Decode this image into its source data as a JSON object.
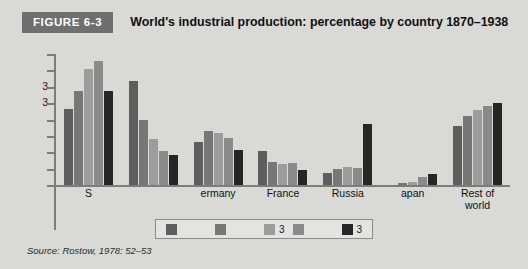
{
  "figure": {
    "badge": "FIGURE 6-3",
    "title": "World's industrial production: percentage by country 1870–1938"
  },
  "source": {
    "text": "Source: Rostow, 1978: 52–53"
  },
  "chart_data": {
    "type": "bar",
    "title": "World's industrial production: percentage by country 1870–1938",
    "xlabel": "",
    "ylabel": "",
    "ylim": [
      0,
      40
    ],
    "grid": false,
    "legend_position": "bottom",
    "axis_note": "Most y-axis tick labels and legend series labels are illegible in the source scan; only two '3' glyphs survive on the y-axis and two '3' glyphs in the legend.",
    "categories": [
      "S",
      "",
      "ermany",
      "France",
      "Russia",
      "apan",
      "Rest of\nworld"
    ],
    "y_tick_labels": [
      "",
      "",
      "3",
      "3",
      "",
      "",
      "",
      "",
      ""
    ],
    "series": [
      {
        "name": "",
        "label_visible": "",
        "color": "#5e5e5e",
        "values": [
          23.3,
          31.8,
          13.2,
          10.3,
          3.7,
          0.0,
          18.0
        ]
      },
      {
        "name": "",
        "label_visible": "",
        "color": "#777777",
        "values": [
          28.6,
          19.9,
          16.6,
          7.1,
          5.0,
          0.6,
          21.0
        ]
      },
      {
        "name": "",
        "label_visible": "3",
        "color": "#9c9c9c",
        "values": [
          35.3,
          14.0,
          15.9,
          6.4,
          5.5,
          1.0,
          23.0
        ]
      },
      {
        "name": "",
        "label_visible": "",
        "color": "#8a8a8a",
        "values": [
          38.0,
          10.4,
          14.3,
          6.6,
          5.3,
          2.5,
          24.0
        ]
      },
      {
        "name": "",
        "label_visible": "3",
        "color": "#262626",
        "values": [
          28.7,
          9.2,
          10.7,
          4.5,
          18.5,
          3.5,
          25.0
        ]
      }
    ]
  },
  "legend": {
    "items": [
      {
        "swatch": "#5e5e5e",
        "label": ""
      },
      {
        "swatch": "#777777",
        "label": ""
      },
      {
        "swatch": "#9c9c9c",
        "label": "3"
      },
      {
        "swatch": "#8a8a8a",
        "label": ""
      },
      {
        "swatch": "#262626",
        "label": "3"
      }
    ]
  }
}
